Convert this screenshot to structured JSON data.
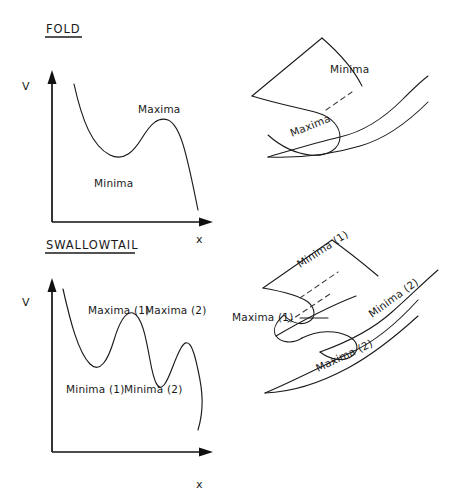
{
  "figure": {
    "width": 454,
    "height": 501,
    "background": "#ffffff",
    "ink": "#1a1a1a"
  },
  "sections": {
    "fold": {
      "heading": "FOLD",
      "heading_pos": {
        "x": 46,
        "y": 33
      },
      "underline": {
        "x1": 45,
        "y1": 37,
        "x2": 82,
        "y2": 37
      }
    },
    "swallowtail": {
      "heading": "SWALLOWTAIL",
      "heading_pos": {
        "x": 46,
        "y": 249
      },
      "underline": {
        "x1": 45,
        "y1": 253,
        "x2": 135,
        "y2": 253
      }
    }
  },
  "plots": {
    "fold_potential": {
      "axis_label_v": "V",
      "axis_label_x": "x",
      "v_label_pos": {
        "x": 22,
        "y": 90
      },
      "x_label_pos": {
        "x": 196,
        "y": 243
      },
      "vertical_axis": {
        "x": 52,
        "y_top": 78,
        "y_bottom": 222
      },
      "horizontal_axis": {
        "y": 222,
        "x_left": 52,
        "x_right": 205
      },
      "curve": "M 74,84 C 82,120 92,146 110,155 C 124,162 134,151 142,138 C 150,125 158,116 168,120 C 180,125 186,150 198,210",
      "labels": [
        {
          "text": "Maxima",
          "x": 138,
          "y": 113
        },
        {
          "text": "Minima",
          "x": 94,
          "y": 187
        }
      ]
    },
    "swallowtail_potential": {
      "axis_label_v": "V",
      "axis_label_x": "x",
      "v_label_pos": {
        "x": 22,
        "y": 306
      },
      "x_label_pos": {
        "x": 196,
        "y": 488
      },
      "vertical_axis": {
        "x": 52,
        "y_top": 286,
        "y_bottom": 452
      },
      "horizontal_axis": {
        "y": 452,
        "x_left": 52,
        "x_right": 205
      },
      "curve": "M 63,289 C 70,320 78,352 90,364 C 100,374 108,360 114,340 C 120,320 126,311 133,313 C 142,316 146,338 150,360 C 154,382 158,392 164,385 C 170,378 174,360 181,348 C 188,336 193,345 198,370 C 203,392 204,410 198,430",
      "labels": [
        {
          "text": "Maxima (1)",
          "x": 88,
          "y": 314
        },
        {
          "text": "Maxima (2)",
          "x": 145,
          "y": 314
        },
        {
          "text": "Minima (1)",
          "x": 66,
          "y": 393
        },
        {
          "text": "Minima (2)",
          "x": 124,
          "y": 393
        }
      ]
    }
  },
  "surfaces": {
    "fold_surface": {
      "upper_sheet_top": "M 252,96 L 322,38",
      "upper_sheet_edge": "M 322,38 C 345,58 356,74 362,86",
      "fold_front": "M 252,96 C 278,104 300,108 318,113 C 332,117 340,127 340,137 C 340,149 327,157 310,155 C 293,153 278,144 268,135",
      "lower_tail": "M 268,157 C 292,150 318,142 340,137 C 362,132 382,120 402,100 C 412,90 420,82 428,76",
      "lower_tail_lower": "M 268,157 C 295,158 330,155 360,146 C 385,139 408,122 428,102",
      "dashed": "M 326,110 L 352,92",
      "labels": [
        {
          "text": "Minima",
          "x": 330,
          "y": 73,
          "rotate": 0
        },
        {
          "text": "Maxima",
          "x": 292,
          "y": 137,
          "rotate": -22
        }
      ]
    },
    "swallowtail_surface": {
      "upper_sheet_top": "M 263,288 L 332,240",
      "upper_sheet_edge": "M 332,240 C 352,254 366,266 378,276",
      "fold_upper": "M 263,288 C 286,292 300,296 308,302 C 316,309 316,318 308,322 C 300,326 290,322 284,315",
      "cusp_mid": "M 284,315 C 276,322 272,330 276,336 C 281,343 293,344 302,338",
      "fold_lower": "M 302,338 C 318,330 336,330 348,336 C 358,341 360,350 352,356 C 344,362 330,360 320,352",
      "lower_sheet_top": "M 320,352 C 348,342 372,330 392,312 C 408,298 424,282 438,270",
      "lower_tail_outer": "M 265,393 C 300,378 330,362 352,352 C 374,342 398,322 418,300",
      "lower_tail_inner": "M 265,393 C 292,392 322,382 348,368 C 372,355 396,336 418,316",
      "mid_sheet_line": "M 276,336 C 300,322 330,306 356,296",
      "dashed_upper": "M 300,298 L 338,272",
      "dashed_lower": "M 288,322 L 330,294",
      "leader_line": "M 300,318 L 328,318",
      "labels": [
        {
          "text": "Minima (1)",
          "x": 300,
          "y": 268,
          "rotate": -33
        },
        {
          "text": "Minima (2)",
          "x": 372,
          "y": 318,
          "rotate": -36
        },
        {
          "text": "Maxima (2)",
          "x": 318,
          "y": 372,
          "rotate": -25
        },
        {
          "text": "Maxima (1)",
          "x": 232,
          "y": 321,
          "rotate": 0
        }
      ]
    }
  }
}
